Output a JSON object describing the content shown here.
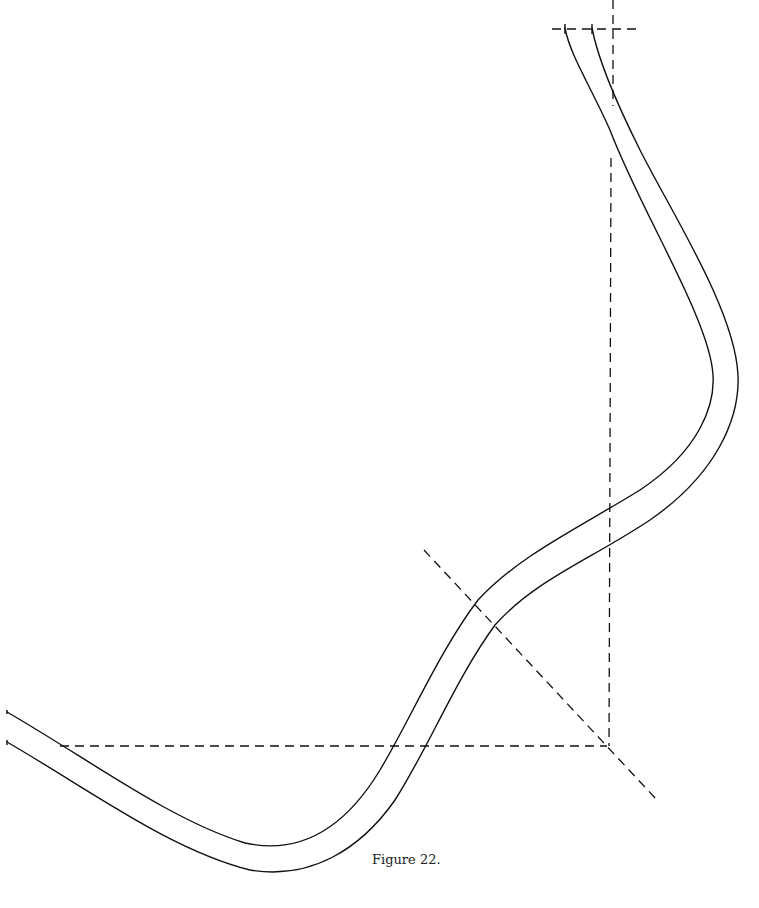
{
  "figure": {
    "caption": "Figure 22.",
    "type": "curved band with dashed construction lines",
    "colors": {
      "stroke": "#111111",
      "background": "#ffffff"
    },
    "curves": [
      {
        "name": "inner-edge",
        "path": "M7,712 C90,760 170,820 245,843 C300,855 345,828 380,770 C410,720 440,650 478,600 C520,555 575,530 640,490 C700,450 715,405 713,375 C710,320 640,210 610,130 C590,85 570,55 565,28"
      },
      {
        "name": "outer-edge",
        "path": "M7,742 C90,790 170,850 250,870 C310,880 360,850 395,800 C430,745 455,680 495,625 C535,580 590,560 650,520 C715,475 740,420 738,375 C735,310 670,210 640,150 C615,100 598,60 592,28"
      }
    ],
    "dashed_lines": [
      {
        "name": "top-horizontal",
        "x1": 552,
        "y1": 29,
        "x2": 642,
        "y2": 29
      },
      {
        "name": "top-vertical",
        "x1": 613,
        "y1": 0,
        "x2": 613,
        "y2": 106
      },
      {
        "name": "right-vertical",
        "x1": 611,
        "y1": 158,
        "x2": 609,
        "y2": 746
      },
      {
        "name": "bottom-horizontal",
        "x1": 60,
        "y1": 746,
        "x2": 607,
        "y2": 746
      },
      {
        "name": "diagonal",
        "x1": 424,
        "y1": 550,
        "x2": 657,
        "y2": 800
      }
    ],
    "ticks": [
      {
        "x1": 565,
        "y1": 24,
        "x2": 565,
        "y2": 34
      },
      {
        "x1": 592,
        "y1": 24,
        "x2": 592,
        "y2": 34
      },
      {
        "x1": 7,
        "y1": 740,
        "x2": 7,
        "y2": 745
      },
      {
        "x1": 7,
        "y1": 710,
        "x2": 7,
        "y2": 714
      }
    ]
  }
}
